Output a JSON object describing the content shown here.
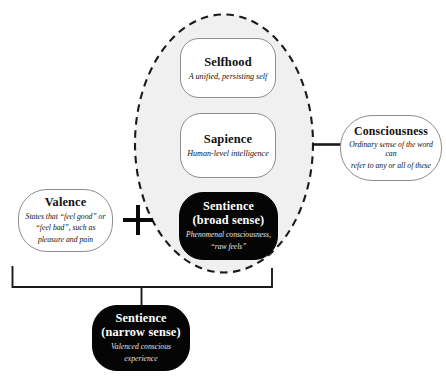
{
  "diagram": {
    "canvas": {
      "width": 446,
      "height": 380,
      "background": "#ffffff"
    },
    "colors": {
      "dark_fill": "#050505",
      "dark_text": "#ffffff",
      "light_fill": "#ffffff",
      "light_text": "#111111",
      "border": "#8e8e8e",
      "ellipse_fill": "#f0f0f0",
      "ellipse_stroke": "#1a1a1a",
      "connector": "#1a1a1a"
    },
    "grouping_ellipse": {
      "name": "consciousness-grouping-ellipse",
      "style": "dashed",
      "fill": "#f0f0f0",
      "contains": [
        "Selfhood",
        "Sapience",
        "Sentience (broad sense)"
      ]
    },
    "nodes": {
      "selfhood": {
        "title": "Selfhood",
        "subtitle": "A unified, persisting self",
        "style": "light"
      },
      "sapience": {
        "title": "Sapience",
        "subtitle": "Human-level intelligence",
        "style": "light"
      },
      "sentience_broad": {
        "title_line1": "Sentience",
        "title_line2": "(broad sense)",
        "subtitle_line1": "Phenomenal consciousness,",
        "subtitle_line2": "“raw feels”",
        "style": "dark"
      },
      "valence": {
        "title": "Valence",
        "subtitle_line1": "States that “feel good” or",
        "subtitle_line2": "“feel bad”, such as",
        "subtitle_line3": "pleasure and pain",
        "style": "light"
      },
      "consciousness": {
        "title": "Consciousness",
        "subtitle_line1": "Ordinary sense of the word can",
        "subtitle_line2": "refer to any or all of these",
        "style": "light"
      },
      "sentience_narrow": {
        "title_line1": "Sentience",
        "title_line2": "(narrow sense)",
        "subtitle_line1": "Valenced conscious",
        "subtitle_line2": "experience",
        "style": "dark"
      }
    },
    "operators": {
      "plus": "+"
    },
    "connectors": [
      {
        "name": "consciousness-link",
        "from": "grouping-ellipse",
        "to": "consciousness",
        "style": "solid"
      },
      {
        "name": "sentience-narrow-bracket",
        "from": [
          "valence",
          "grouping-ellipse"
        ],
        "to": "sentience_narrow",
        "style": "bracket"
      }
    ]
  }
}
